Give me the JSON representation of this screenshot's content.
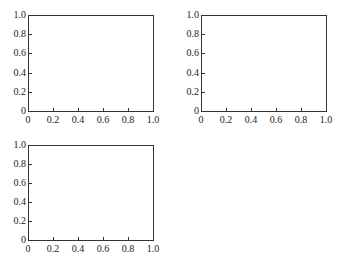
{
  "chart_data": [
    {
      "type": "line",
      "title": "",
      "xlabel": "",
      "ylabel": "",
      "xlim": [
        0,
        1.0
      ],
      "ylim": [
        0,
        1.0
      ],
      "x_ticks": [
        "0",
        "0.2",
        "0.4",
        "0.6",
        "0.8",
        "1.0"
      ],
      "y_ticks": [
        "0",
        "0.2",
        "0.4",
        "0.6",
        "0.8",
        "1.0"
      ],
      "grid": false,
      "series": [],
      "position": "top-left"
    },
    {
      "type": "line",
      "title": "",
      "xlabel": "",
      "ylabel": "",
      "xlim": [
        0,
        1.0
      ],
      "ylim": [
        0,
        1.0
      ],
      "x_ticks": [
        "0",
        "0.2",
        "0.4",
        "0.6",
        "0.8",
        "1.0"
      ],
      "y_ticks": [
        "0",
        "0.2",
        "0.4",
        "0.6",
        "0.8",
        "1.0"
      ],
      "grid": false,
      "series": [],
      "position": "top-right"
    },
    {
      "type": "line",
      "title": "",
      "xlabel": "",
      "ylabel": "",
      "xlim": [
        0,
        1.0
      ],
      "ylim": [
        0,
        1.0
      ],
      "x_ticks": [
        "0",
        "0.2",
        "0.4",
        "0.6",
        "0.8",
        "1.0"
      ],
      "y_ticks": [
        "0",
        "0.2",
        "0.4",
        "0.6",
        "0.8",
        "1.0"
      ],
      "grid": false,
      "series": [],
      "position": "bottom-left"
    }
  ],
  "layout": {
    "axes": [
      {
        "left": 28,
        "top": 15,
        "width": 126,
        "height": 97
      },
      {
        "left": 201,
        "top": 15,
        "width": 126,
        "height": 97
      },
      {
        "left": 28,
        "top": 145,
        "width": 126,
        "height": 96
      }
    ],
    "axis_color": "#333333"
  }
}
